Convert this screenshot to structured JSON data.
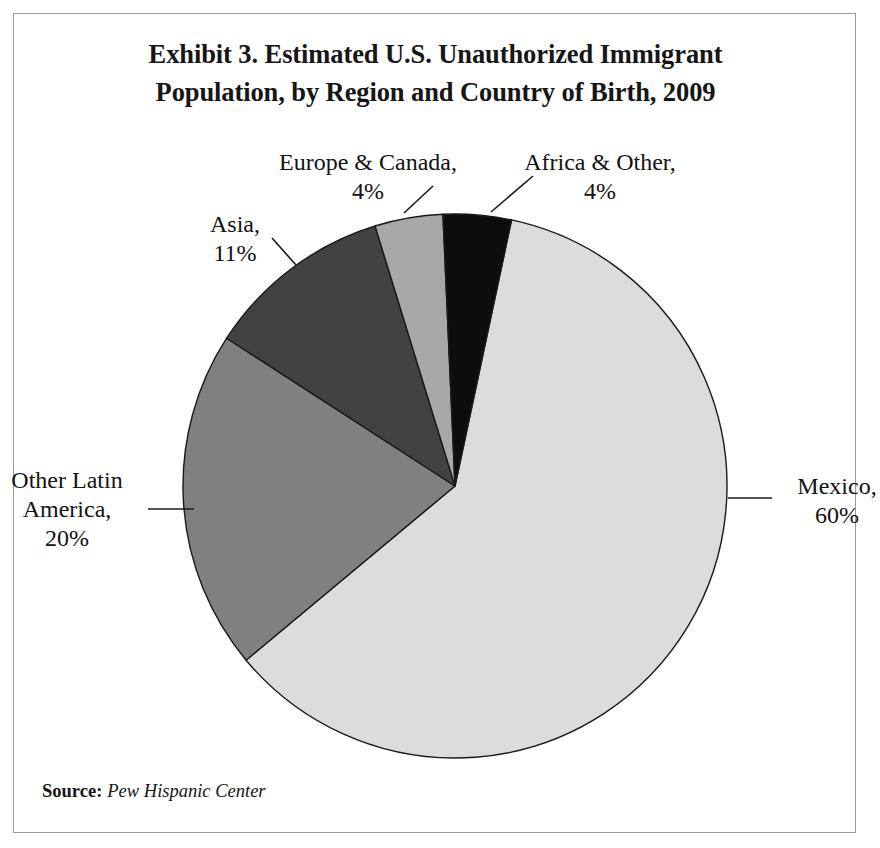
{
  "figure": {
    "title_lines": [
      "Exhibit 3. Estimated U.S. Unauthorized Immigrant",
      "Population, by Region and Country of Birth, 2009"
    ],
    "source_key": "Source:",
    "source_value": "Pew Hispanic Center",
    "border_color": "#9a9a9a",
    "background": "#ffffff"
  },
  "labels": {
    "mexico": {
      "name": "Mexico,",
      "pct": "60%"
    },
    "other_latin_america": {
      "name_line1": "Other Latin",
      "name_line2": "America,",
      "pct": "20%"
    },
    "asia": {
      "name": "Asia,",
      "pct": "11%"
    },
    "europe_canada": {
      "name": "Europe & Canada,",
      "pct": "4%"
    },
    "africa_other": {
      "name": "Africa & Other,",
      "pct": "4%"
    }
  },
  "chart_data": {
    "type": "pie",
    "title": "Exhibit 3. Estimated U.S. Unauthorized Immigrant Population, by Region and Country of Birth, 2009",
    "xlabel": "",
    "ylabel": "",
    "units": "percent",
    "legend": "none",
    "grid": false,
    "value_labels": true,
    "start_angle_deg": 12,
    "direction": "clockwise",
    "categories": [
      "Mexico",
      "Other Latin America",
      "Asia",
      "Europe & Canada",
      "Africa & Other"
    ],
    "values": [
      60,
      20,
      11,
      4,
      4
    ],
    "labels": [
      "60%",
      "20%",
      "11%",
      "4%",
      "4%"
    ],
    "colors": [
      "#dcdcdc",
      "#808080",
      "#424242",
      "#a8a8a8",
      "#0d0d0d"
    ],
    "slices": [
      {
        "label": "Mexico",
        "value": 60,
        "display": "60%",
        "color": "#dcdcdc"
      },
      {
        "label": "Other Latin America",
        "value": 20,
        "display": "20%",
        "color": "#808080"
      },
      {
        "label": "Asia",
        "value": 11,
        "display": "11%",
        "color": "#424242"
      },
      {
        "label": "Europe & Canada",
        "value": 4,
        "display": "4%",
        "color": "#a8a8a8"
      },
      {
        "label": "Africa & Other",
        "value": 4,
        "display": "4%",
        "color": "#0d0d0d"
      }
    ],
    "source": "Pew Hispanic Center"
  }
}
